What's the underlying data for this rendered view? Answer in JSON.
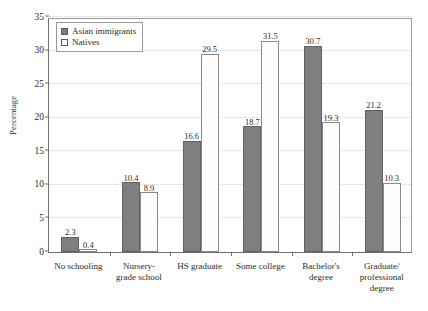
{
  "chart_data": {
    "type": "bar",
    "title": "",
    "xlabel": "",
    "ylabel": "Percentage",
    "ylim": [
      0,
      35
    ],
    "yticks": [
      0,
      5,
      10,
      15,
      20,
      25,
      30,
      35
    ],
    "grid": true,
    "legend_position": "top-left",
    "categories": [
      "No schooling",
      "Nursery-grade school",
      "HS graduate",
      "Some college",
      "Bachelor's degree",
      "Graduate/professional degree"
    ],
    "category_lines": [
      [
        "No schooling"
      ],
      [
        "Nursery-",
        "grade school"
      ],
      [
        "HS graduate"
      ],
      [
        "Some college"
      ],
      [
        "Bachelor's",
        "degree"
      ],
      [
        "Graduate/",
        "professional",
        "degree"
      ]
    ],
    "series": [
      {
        "name": "Asian immigrants",
        "color": "#7f7f7f",
        "values": [
          2.3,
          10.4,
          16.6,
          18.7,
          30.7,
          21.2
        ]
      },
      {
        "name": "Natives",
        "color": "#fdfdfd",
        "values": [
          0.4,
          8.9,
          29.5,
          31.5,
          19.3,
          10.3
        ]
      }
    ]
  },
  "legend": {
    "items": [
      {
        "label": "Asian immigrants",
        "swatch": "filled-square-swatch"
      },
      {
        "label": "Natives",
        "swatch": "open-square-swatch"
      }
    ]
  },
  "axes": {
    "y_title": "Percentage",
    "y_tick_labels": [
      "0",
      "5",
      "10",
      "15",
      "20",
      "25",
      "30",
      "35"
    ]
  }
}
